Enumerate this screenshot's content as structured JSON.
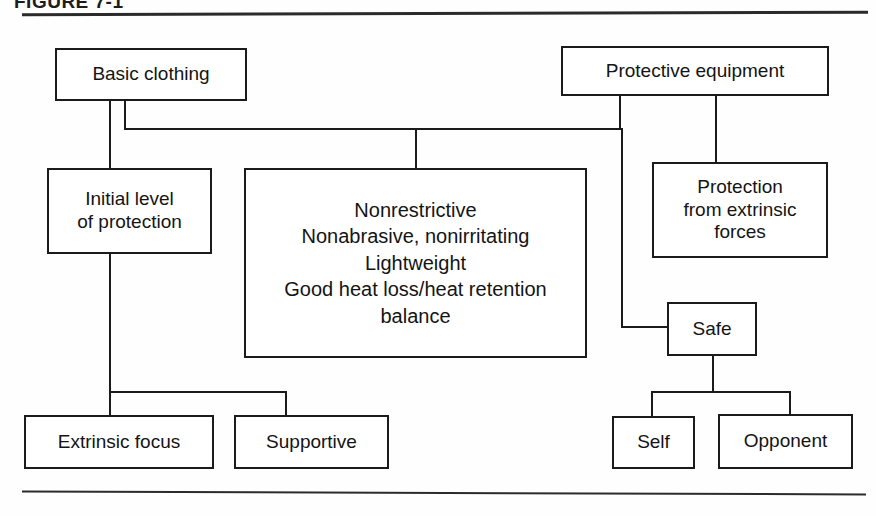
{
  "figure": {
    "caption": "FIGURE 7-1",
    "top_rule": true,
    "bottom_rule": true
  },
  "diagram": {
    "type": "hierarchy-flowchart",
    "nodes": {
      "basic_clothing": "Basic clothing",
      "protective_equipment": "Protective equipment",
      "initial_level": "Initial level\nof protection",
      "initial_level_line1": "Initial level",
      "initial_level_line2": "of protection",
      "criteria_line1": "Nonrestrictive",
      "criteria_line2": "Nonabrasive, nonirritating",
      "criteria_line3": "Lightweight",
      "criteria_line4": "Good heat loss/heat retention",
      "criteria_line5": "balance",
      "protection_extrinsic_line1": "Protection",
      "protection_extrinsic_line2": "from extrinsic",
      "protection_extrinsic_line3": "forces",
      "safe": "Safe",
      "extrinsic_focus": "Extrinsic focus",
      "supportive": "Supportive",
      "self": "Self",
      "opponent": "Opponent"
    },
    "colors": {
      "line": "#1b1b1b",
      "box_fill": "#ffffff",
      "text": "#141414",
      "background": "#fefefe"
    },
    "edges": [
      "basic_clothing -> initial_level",
      "basic_clothing -> criteria_box",
      "protective_equipment -> criteria_box",
      "protective_equipment -> protection_extrinsic",
      "protective_equipment -> safe",
      "initial_level -> extrinsic_focus",
      "initial_level -> supportive",
      "safe -> self",
      "safe -> opponent"
    ]
  }
}
